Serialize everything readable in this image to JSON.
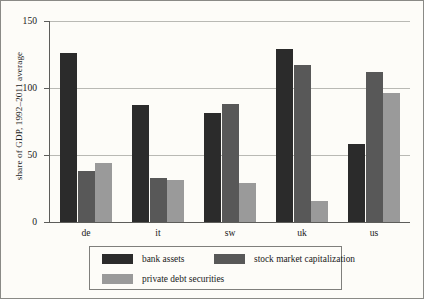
{
  "chart_data": {
    "type": "bar",
    "title": "",
    "xlabel": "",
    "ylabel": "share of GDP, 1992–2011 average",
    "ylim": [
      0,
      150
    ],
    "yticks": [
      0,
      50,
      100,
      150
    ],
    "ytick_labels": [
      "0",
      "50",
      "100",
      "150"
    ],
    "grid": true,
    "legend_position": "bottom",
    "categories": [
      "de",
      "it",
      "sw",
      "uk",
      "us"
    ],
    "series": [
      {
        "name": "bank assets",
        "color": "#2b2b2b",
        "values": [
          126,
          87,
          81,
          129,
          58
        ]
      },
      {
        "name": "stock market capitalization",
        "color": "#585858",
        "values": [
          38,
          33,
          88,
          117,
          112
        ]
      },
      {
        "name": "private debt securities",
        "color": "#9a9a9a",
        "values": [
          44,
          31,
          29,
          16,
          96
        ]
      }
    ]
  },
  "figure": {
    "background_color": "#fdfcf8",
    "axis_color": "#5d5d5a",
    "gridline_color": "#b9b9b4",
    "border_color": "#8a8a86"
  }
}
